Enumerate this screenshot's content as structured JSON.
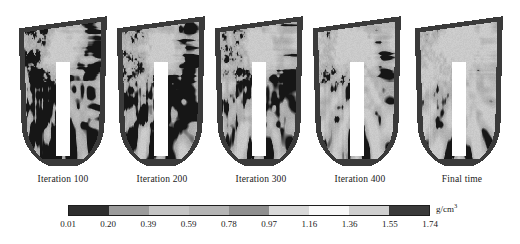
{
  "figure": {
    "type": "bone-density-remodeling-simulation"
  },
  "panels": [
    {
      "caption": "Iteration 100",
      "seed": 101,
      "black_fraction": 0.17,
      "porosity_spread": 0.55
    },
    {
      "caption": "Iteration 200",
      "seed": 202,
      "black_fraction": 0.27,
      "porosity_spread": 0.68
    },
    {
      "caption": "Iteration 300",
      "seed": 303,
      "black_fraction": 0.36,
      "porosity_spread": 0.78
    },
    {
      "caption": "Iteration 400",
      "seed": 404,
      "black_fraction": 0.45,
      "porosity_spread": 0.86
    },
    {
      "caption": "Final time",
      "seed": 505,
      "black_fraction": 0.5,
      "porosity_spread": 0.92
    }
  ],
  "colorbar": {
    "units": "g/cm",
    "units_exponent": "3",
    "ticks": [
      "0.01",
      "0.20",
      "0.39",
      "0.59",
      "0.78",
      "0.97",
      "1.16",
      "1.36",
      "1.55",
      "1.74"
    ],
    "segment_colors": [
      "#2e2e2e",
      "#9b9b9b",
      "#c4c4c4",
      "#b4b4b4",
      "#8f8f8f",
      "#d8d8d8",
      "#f8f8f8",
      "#cfcfcf",
      "#3a3a3a"
    ]
  },
  "chart_data": {
    "type": "heatmap",
    "title": "",
    "xlabel": "",
    "ylabel": "",
    "colorbar_label": "g/cm3",
    "colorbar_ticks": [
      0.01,
      0.2,
      0.39,
      0.59,
      0.78,
      0.97,
      1.16,
      1.36,
      1.55,
      1.74
    ],
    "colorbar_range": [
      0.01,
      1.74
    ],
    "legend_position": "bottom",
    "grid": false,
    "categories": [
      "Iteration 100",
      "Iteration 200",
      "Iteration 300",
      "Iteration 400",
      "Final time"
    ],
    "series": [
      {
        "name": "mean apparent density (g/cm3)",
        "values": [
          1.02,
          0.94,
          0.86,
          0.79,
          0.75
        ]
      }
    ]
  }
}
